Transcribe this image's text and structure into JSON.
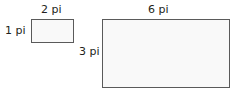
{
  "diagram": {
    "small_rectangle": {
      "width_label": "2 pi",
      "height_label": "1 pi"
    },
    "large_rectangle": {
      "width_label": "6 pi",
      "height_label": "3 pi"
    }
  }
}
